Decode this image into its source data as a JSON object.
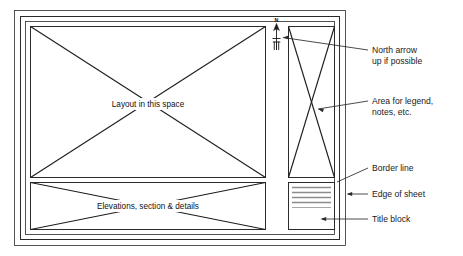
{
  "diagram": {
    "sheet": {
      "edge_label": "Edge of sheet",
      "border_label": "Border line"
    },
    "zones": [
      {
        "id": "layout",
        "label": "Layout in this space",
        "marker": "x-cross"
      },
      {
        "id": "elevations",
        "label": "Elevations, section & details",
        "marker": "x-cross"
      },
      {
        "id": "legend",
        "label": "",
        "marker": "x-cross"
      },
      {
        "id": "title-block",
        "label": "",
        "marker": "ruled-lines"
      }
    ],
    "north_arrow": {
      "letter": "N",
      "icon": "north-arrow-icon"
    },
    "callouts": [
      {
        "id": "north-arrow",
        "lines": [
          "North arrow",
          "up if possible"
        ]
      },
      {
        "id": "legend-area",
        "lines": [
          "Area for legend,",
          "notes, etc."
        ]
      },
      {
        "id": "border-line",
        "lines": [
          "Border line"
        ]
      },
      {
        "id": "edge-of-sheet",
        "lines": [
          "Edge of sheet"
        ]
      },
      {
        "id": "title-block",
        "lines": [
          "Title block"
        ]
      }
    ],
    "colors": {
      "line": "#2b2b2b",
      "diagonal": "#1f1f1f",
      "text": "#1a1a1a",
      "titleblock_rule": "#8d8d8d",
      "background": "#ffffff"
    }
  }
}
